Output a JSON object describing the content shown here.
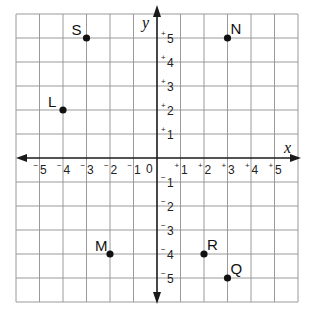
{
  "diagram": {
    "type": "coordinate-plane",
    "x_axis_label": "x",
    "y_axis_label": "y",
    "origin_label": "0",
    "range": {
      "x": [
        -6,
        6
      ],
      "y": [
        -6,
        6
      ]
    },
    "grid": true,
    "x_ticks": [
      {
        "value": -5,
        "sign": "−",
        "digit": "5"
      },
      {
        "value": -4,
        "sign": "−",
        "digit": "4"
      },
      {
        "value": -3,
        "sign": "−",
        "digit": "3"
      },
      {
        "value": -2,
        "sign": "−",
        "digit": "2"
      },
      {
        "value": -1,
        "sign": "−",
        "digit": "1"
      },
      {
        "value": 1,
        "sign": "+",
        "digit": "1"
      },
      {
        "value": 2,
        "sign": "+",
        "digit": "2"
      },
      {
        "value": 3,
        "sign": "+",
        "digit": "3"
      },
      {
        "value": 4,
        "sign": "+",
        "digit": "4"
      },
      {
        "value": 5,
        "sign": "+",
        "digit": "5"
      }
    ],
    "y_ticks": [
      {
        "value": 5,
        "sign": "+",
        "digit": "5"
      },
      {
        "value": 4,
        "sign": "+",
        "digit": "4"
      },
      {
        "value": 3,
        "sign": "+",
        "digit": "3"
      },
      {
        "value": 2,
        "sign": "+",
        "digit": "2"
      },
      {
        "value": 1,
        "sign": "+",
        "digit": "1"
      },
      {
        "value": -1,
        "sign": "−",
        "digit": "1"
      },
      {
        "value": -2,
        "sign": "−",
        "digit": "2"
      },
      {
        "value": -3,
        "sign": "−",
        "digit": "3"
      },
      {
        "value": -4,
        "sign": "−",
        "digit": "4"
      },
      {
        "value": -5,
        "sign": "−",
        "digit": "5"
      }
    ],
    "points": [
      {
        "label": "S",
        "x": -3,
        "y": 5,
        "label_pos": "upper-left"
      },
      {
        "label": "N",
        "x": 3,
        "y": 5,
        "label_pos": "upper-right"
      },
      {
        "label": "L",
        "x": -4,
        "y": 2,
        "label_pos": "upper-left"
      },
      {
        "label": "M",
        "x": -2,
        "y": -4,
        "label_pos": "upper-left"
      },
      {
        "label": "R",
        "x": 2,
        "y": -4,
        "label_pos": "upper-right"
      },
      {
        "label": "Q",
        "x": 3,
        "y": -5,
        "label_pos": "upper-right"
      }
    ],
    "colors": {
      "grid": "#9a9a9a",
      "axis": "#1a1a1a",
      "point": "#111111"
    }
  }
}
